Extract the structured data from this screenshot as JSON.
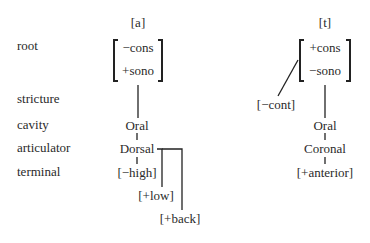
{
  "row_labels": [
    "root",
    "stricture",
    "cavity",
    "articulator",
    "terminal"
  ],
  "trees": [
    {
      "segment": "[a]",
      "root_features": [
        "−cons",
        "+sono"
      ],
      "cavity": "Oral",
      "articulator": "Dorsal",
      "terminals": [
        "[−high]",
        "[+low]",
        "[+back]"
      ]
    },
    {
      "segment": "[t]",
      "root_features": [
        "+cons",
        "−sono"
      ],
      "stricture": "[−cont]",
      "cavity": "Oral",
      "articulator": "Coronal",
      "terminals": [
        "[+anterior]"
      ]
    }
  ]
}
